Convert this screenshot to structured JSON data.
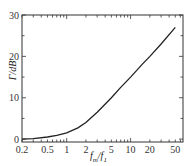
{
  "chart_data": {
    "type": "line",
    "title": "",
    "xlabel": "f_m/f_1",
    "ylabel": "Γ/dB",
    "xscale": "log",
    "xlim": [
      0.2,
      66
    ],
    "ylim": [
      -0.7,
      30
    ],
    "xticks": [
      "0.2",
      "0.5",
      "1",
      "2",
      "5",
      "10",
      "20",
      "50"
    ],
    "yticks": [
      "0",
      "10",
      "20",
      "30"
    ],
    "grid": false,
    "legend": null,
    "series": [
      {
        "name": "Γ",
        "x": [
          0.2,
          0.3,
          0.5,
          0.7,
          1,
          1.5,
          2,
          3,
          5,
          7,
          10,
          15,
          20,
          30,
          50
        ],
        "values": [
          0,
          0.1,
          0.5,
          0.9,
          1.5,
          2.7,
          4,
          6.5,
          10,
          12.5,
          15,
          18,
          20,
          23,
          27
        ]
      }
    ]
  },
  "labels": {
    "x": "f",
    "x_sub1": "m",
    "x_mid": "/f",
    "x_sub2": "1",
    "y": "Γ/dB"
  }
}
